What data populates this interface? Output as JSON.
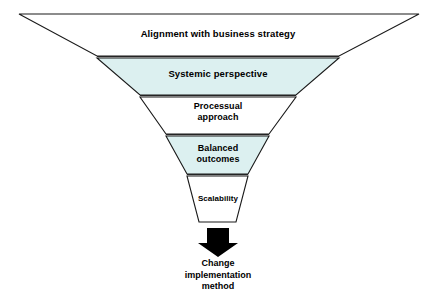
{
  "diagram": {
    "type": "funnel",
    "background_color": "#ffffff",
    "outline_color": "#1a1a1a",
    "highlight_fill": "#dcf0f0",
    "plain_fill": "#ffffff",
    "arrow_color": "#000000",
    "stages": [
      {
        "index": 0,
        "label": "Alignment with business strategy",
        "fill": "#ffffff",
        "filled": false
      },
      {
        "index": 1,
        "label": "Systemic perspective",
        "fill": "#dcf0f0",
        "filled": true
      },
      {
        "index": 2,
        "label": "Processual\napproach",
        "fill": "#ffffff",
        "filled": false
      },
      {
        "index": 3,
        "label": "Balanced\noutcomes",
        "fill": "#dcf0f0",
        "filled": true
      },
      {
        "index": 4,
        "label": "Scalability",
        "fill": "#ffffff",
        "filled": false
      }
    ],
    "outcome": {
      "label": "Change\nimplementation\nmethod",
      "arrow_direction": "down"
    }
  }
}
